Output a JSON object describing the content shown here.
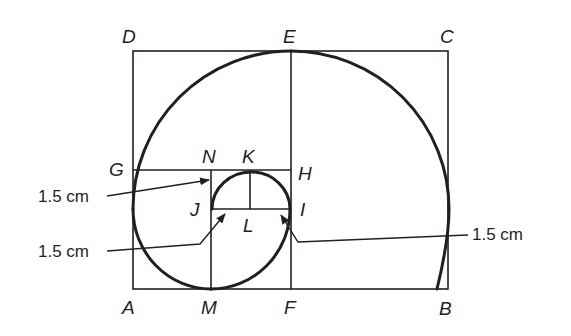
{
  "figure": {
    "type": "golden-spiral-construction",
    "colors": {
      "line": "#231f20",
      "background": "#ffffff"
    },
    "points": {
      "A": "A",
      "B": "B",
      "C": "C",
      "D": "D",
      "E": "E",
      "F": "F",
      "G": "G",
      "H": "H",
      "I": "I",
      "J": "J",
      "K": "K",
      "L": "L",
      "M": "M",
      "N": "N"
    },
    "dimensions": [
      {
        "label": "1.5 cm",
        "target": "N-J segment"
      },
      {
        "label": "1.5 cm",
        "target": "J-L segment"
      },
      {
        "label": "1.5 cm",
        "target": "L-I segment"
      }
    ]
  }
}
